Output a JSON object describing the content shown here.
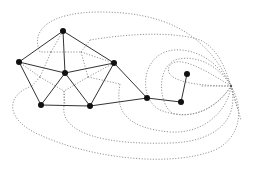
{
  "diagram": {
    "type": "planar graph with dual graph",
    "primal_graph": {
      "style": "solid lines, black filled nodes",
      "nodes": [
        {
          "id": "top",
          "x": 63,
          "y": 31
        },
        {
          "id": "left",
          "x": 19,
          "y": 62
        },
        {
          "id": "center",
          "x": 65,
          "y": 73
        },
        {
          "id": "right",
          "x": 114,
          "y": 63
        },
        {
          "id": "bottom-left",
          "x": 41,
          "y": 105
        },
        {
          "id": "bottom-right",
          "x": 90,
          "y": 106
        },
        {
          "id": "path-1",
          "x": 147,
          "y": 98
        },
        {
          "id": "path-2",
          "x": 181,
          "y": 102
        },
        {
          "id": "pendant",
          "x": 187,
          "y": 74
        }
      ],
      "edges": [
        [
          "top",
          "left"
        ],
        [
          "top",
          "right"
        ],
        [
          "top",
          "center"
        ],
        [
          "left",
          "center"
        ],
        [
          "right",
          "center"
        ],
        [
          "left",
          "bottom-left"
        ],
        [
          "right",
          "bottom-right"
        ],
        [
          "center",
          "bottom-left"
        ],
        [
          "center",
          "bottom-right"
        ],
        [
          "bottom-left",
          "bottom-right"
        ],
        [
          "bottom-right",
          "path-1"
        ],
        [
          "right",
          "path-1"
        ],
        [
          "path-1",
          "path-2"
        ],
        [
          "path-2",
          "pendant"
        ]
      ]
    },
    "dual_graph": {
      "style": "dotted gray lines",
      "outer_face_hub": {
        "x": 231,
        "y": 86
      }
    }
  }
}
